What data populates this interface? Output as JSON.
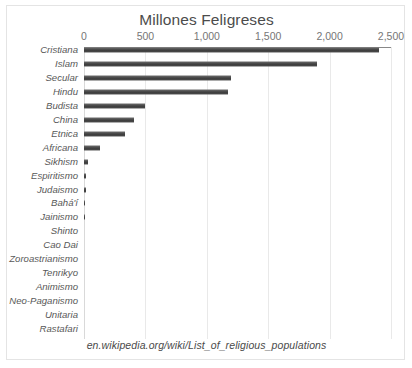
{
  "chart_data": {
    "type": "bar",
    "orientation": "horizontal",
    "title": "Millones Feligreses",
    "xlabel": "",
    "ylabel": "",
    "xlim": [
      0,
      2500
    ],
    "xticks": [
      0,
      500,
      1000,
      1500,
      2000,
      2500
    ],
    "xticklabels": [
      "0",
      "500",
      "1,000",
      "1,500",
      "2,000",
      "2,500"
    ],
    "grid": true,
    "legend": false,
    "bar_color": "#464646",
    "categories": [
      "Cristiana",
      "Islam",
      "Secular",
      "Hindu",
      "Budista",
      "China",
      "Etnica",
      "Africana",
      "Sikhism",
      "Espiritismo",
      "Judaismo",
      "Bahá'í",
      "Jainismo",
      "Shinto",
      "Cao Dai",
      "Zoroastrianismo",
      "Tenrikyo",
      "Animismo",
      "Neo-Paganismo",
      "Unitaria",
      "Rastafari"
    ],
    "values": [
      2400,
      1900,
      1200,
      1175,
      500,
      410,
      330,
      130,
      30,
      15,
      14,
      7,
      4.5,
      4,
      4,
      2.6,
      2,
      1.5,
      1,
      0.8,
      0.6
    ]
  },
  "source_note": "en.wikipedia.org/wiki/List_of_religious_populations"
}
